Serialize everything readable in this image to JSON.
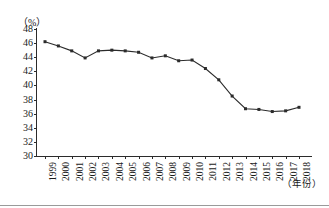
{
  "chart_data": {
    "type": "line",
    "title": "",
    "subtitle": "",
    "xlabel": "（年份）",
    "ylabel": "（%）",
    "unit": "%",
    "grid": false,
    "legend": "none",
    "ylim": [
      30,
      48
    ],
    "ytick_step": 2,
    "yticks": [
      48,
      46,
      44,
      42,
      40,
      38,
      36,
      34,
      32,
      30
    ],
    "xlim": [
      1999,
      2018
    ],
    "categories": [
      "1999",
      "2000",
      "2001",
      "2002",
      "2003",
      "2004",
      "2005",
      "2006",
      "2007",
      "2008",
      "2009",
      "2010",
      "2011",
      "2012",
      "2013",
      "2014",
      "2015",
      "2016",
      "2017",
      "2018"
    ],
    "series": [
      {
        "name": "比重",
        "marker": "square",
        "color": "#2b2b2b",
        "values": [
          46.2,
          45.6,
          44.9,
          43.9,
          44.9,
          45.0,
          44.9,
          44.7,
          43.9,
          44.2,
          43.5,
          43.6,
          42.4,
          40.8,
          38.5,
          36.7,
          36.6,
          36.3,
          36.4,
          36.9
        ]
      }
    ]
  },
  "axis": {
    "y_unit_label": "（%）",
    "x_axis_title": "（年份）"
  }
}
